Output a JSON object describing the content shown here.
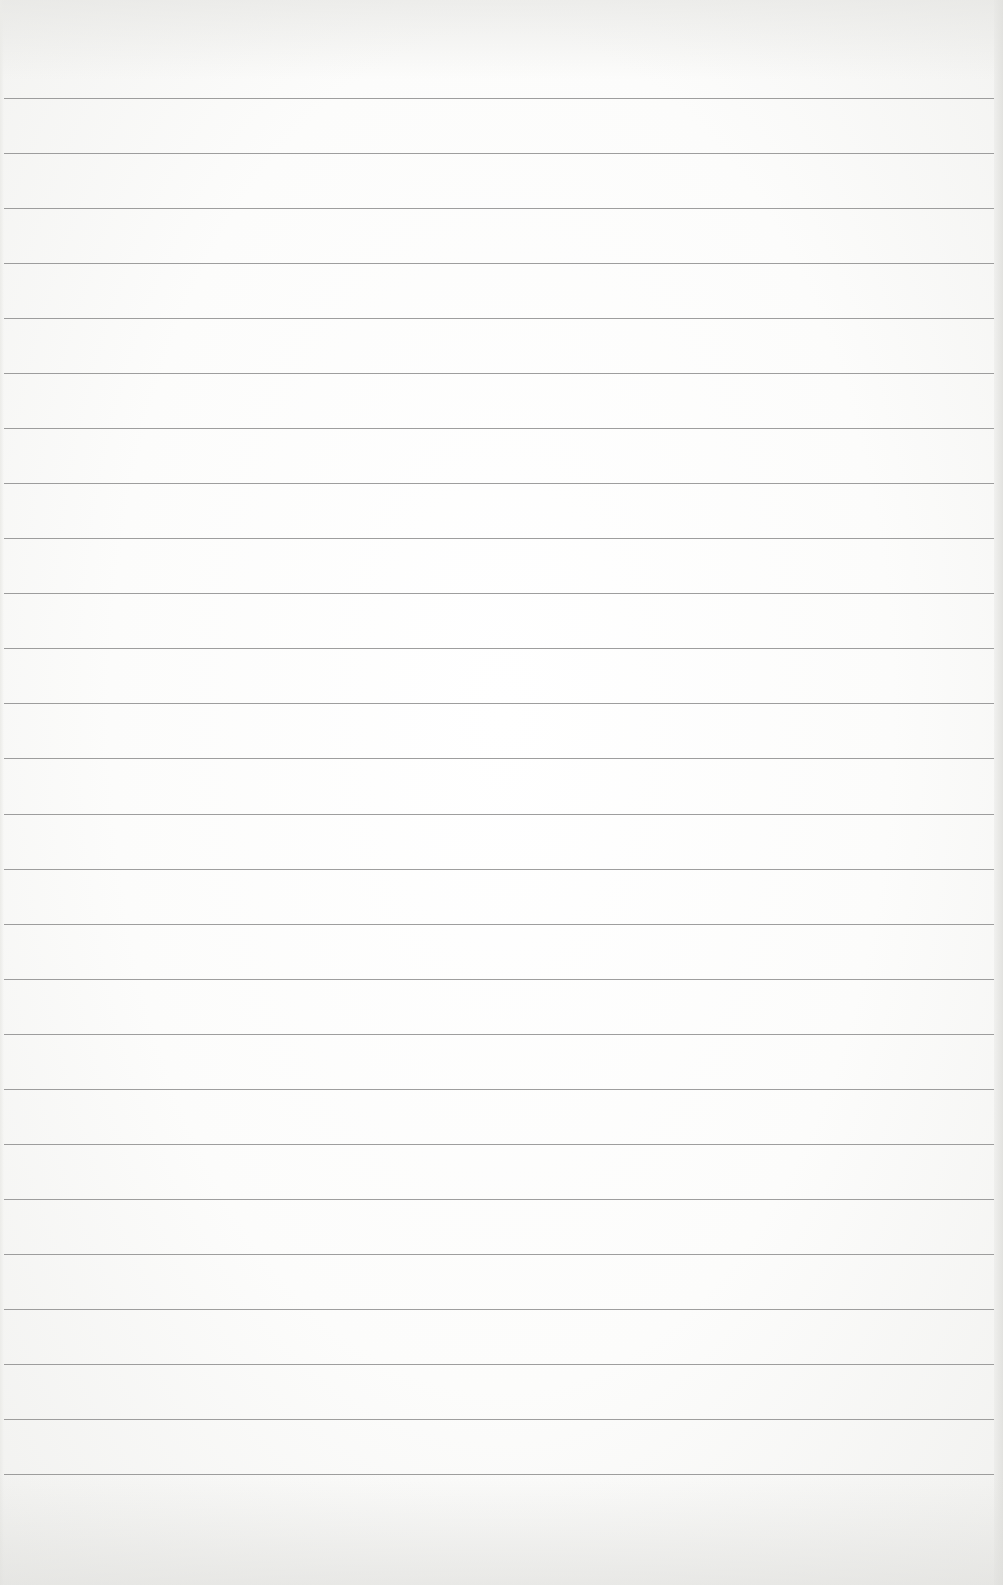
{
  "page": {
    "type": "lined-paper",
    "background_color": "#fdfdfc",
    "rule_color": "#8d8d8d",
    "rule_count": 26,
    "first_rule_y": 98,
    "rule_spacing": 55.04,
    "rule_left_x": 4,
    "rule_right_x": 994,
    "text": ""
  }
}
